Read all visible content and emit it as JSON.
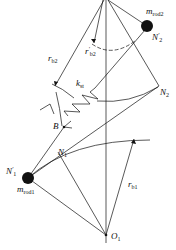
{
  "diagram": {
    "labels": {
      "m_rod2": {
        "base": "m",
        "sub": "rod2"
      },
      "N2_prime": {
        "base": "N",
        "sup": "′",
        "sub": "2"
      },
      "r_b2_prime": {
        "base": "r",
        "sup": "′",
        "sub": "b2"
      },
      "r_b2": {
        "base": "r",
        "sub": "b2"
      },
      "k_st": {
        "base": "k",
        "sub": "st"
      },
      "N2": {
        "base": "N",
        "sub": "2"
      },
      "B": {
        "base": "B"
      },
      "N1": {
        "base": "N",
        "sub": "1"
      },
      "N1_prime": {
        "base": "N",
        "sup": "′",
        "sub": "1"
      },
      "m_rod1": {
        "base": "m",
        "sub": "rod1"
      },
      "r_b1": {
        "base": "r",
        "sub": "b1"
      },
      "O1": {
        "base": "O",
        "sub": "1"
      }
    },
    "colors": {
      "stroke": "#111111",
      "background": "#ffffff"
    }
  }
}
